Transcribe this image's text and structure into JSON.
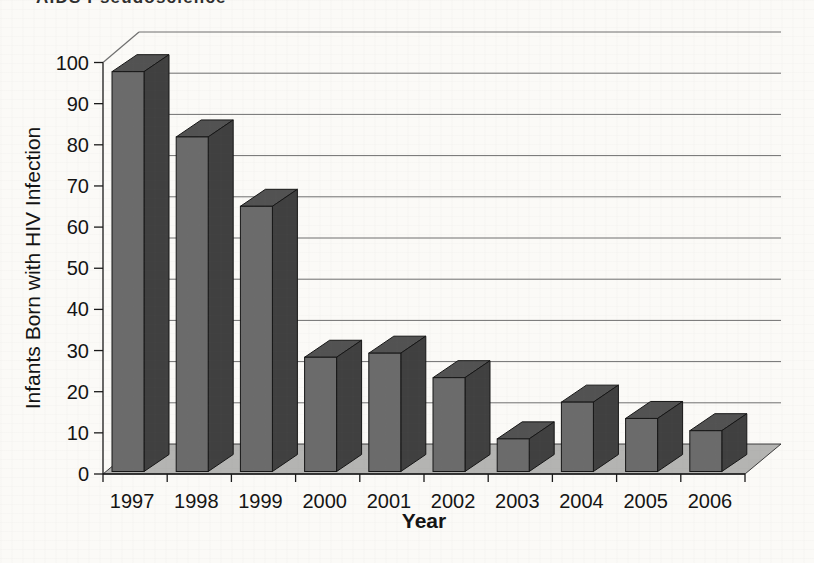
{
  "page": {
    "header_text": "AIDS Pseudoscience"
  },
  "chart_data": {
    "type": "bar",
    "variant": "3d-column",
    "title": "",
    "categories": [
      "1997",
      "1998",
      "1999",
      "2000",
      "2001",
      "2002",
      "2003",
      "2004",
      "2005",
      "2006"
    ],
    "values": [
      98,
      82,
      65,
      28,
      29,
      23,
      8,
      17,
      13,
      10
    ],
    "xlabel": "Year",
    "ylabel": "Infants Born with HIV Infection",
    "ylim": [
      0,
      100
    ],
    "yticks": [
      0,
      10,
      20,
      30,
      40,
      50,
      60,
      70,
      80,
      90,
      100
    ],
    "grid": "horizontal gridlines on back wall, every 10 units",
    "legend": "none",
    "colors": {
      "bar_front": "#6b6b6b",
      "bar_side": "#404040",
      "bar_top": "#525252",
      "bar_outline": "#161616",
      "floor": "#b4b4b2",
      "gridline": "#6f6f6f",
      "axis": "#1a1a1a",
      "text": "#141414",
      "background": "#fbfaf7"
    }
  }
}
